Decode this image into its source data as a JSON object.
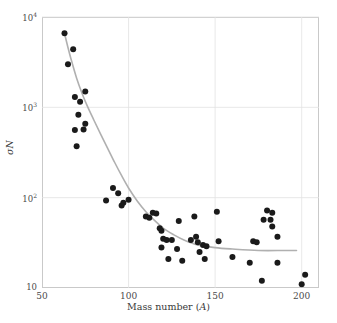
{
  "chart_data": {
    "type": "scatter",
    "title": "",
    "xlabel": "Mass number (A)",
    "ylabel": "σN",
    "xlabel_plain": "Mass number",
    "xlabel_symbol": "A",
    "ylabel_symbol": "σN",
    "xlim": [
      50,
      210
    ],
    "ylim": [
      10,
      10000
    ],
    "yscale": "log",
    "xscale": "linear",
    "grid": true,
    "legend": null,
    "xticks": [
      50,
      100,
      150,
      200
    ],
    "xtick_labels": [
      "50",
      "100",
      "150",
      "200"
    ],
    "yticks": [
      10,
      100,
      1000,
      10000
    ],
    "ytick_labels": [
      "10",
      "10²",
      "10³",
      "10⁴"
    ],
    "marker": {
      "shape": "circle",
      "color": "#1a1a1a",
      "size": 3.0
    },
    "points": [
      {
        "x": 63,
        "y": 6600
      },
      {
        "x": 68,
        "y": 4400
      },
      {
        "x": 65,
        "y": 3000
      },
      {
        "x": 69,
        "y": 1300
      },
      {
        "x": 75,
        "y": 1500
      },
      {
        "x": 72,
        "y": 1150
      },
      {
        "x": 71,
        "y": 830
      },
      {
        "x": 75,
        "y": 660
      },
      {
        "x": 69,
        "y": 560
      },
      {
        "x": 74,
        "y": 570
      },
      {
        "x": 70,
        "y": 370
      },
      {
        "x": 87,
        "y": 93
      },
      {
        "x": 91,
        "y": 128
      },
      {
        "x": 94,
        "y": 112
      },
      {
        "x": 97,
        "y": 88
      },
      {
        "x": 96,
        "y": 82
      },
      {
        "x": 100,
        "y": 95
      },
      {
        "x": 110,
        "y": 62
      },
      {
        "x": 112,
        "y": 60
      },
      {
        "x": 114,
        "y": 68
      },
      {
        "x": 116,
        "y": 67
      },
      {
        "x": 118,
        "y": 46
      },
      {
        "x": 119,
        "y": 43
      },
      {
        "x": 120,
        "y": 35
      },
      {
        "x": 119,
        "y": 28
      },
      {
        "x": 122,
        "y": 34
      },
      {
        "x": 123,
        "y": 21
      },
      {
        "x": 125,
        "y": 34
      },
      {
        "x": 128,
        "y": 27
      },
      {
        "x": 129,
        "y": 55
      },
      {
        "x": 131,
        "y": 20
      },
      {
        "x": 136,
        "y": 34
      },
      {
        "x": 138,
        "y": 62
      },
      {
        "x": 139,
        "y": 37
      },
      {
        "x": 140,
        "y": 32
      },
      {
        "x": 141,
        "y": 25
      },
      {
        "x": 143,
        "y": 30
      },
      {
        "x": 144,
        "y": 21
      },
      {
        "x": 145,
        "y": 29
      },
      {
        "x": 151,
        "y": 70
      },
      {
        "x": 152,
        "y": 33
      },
      {
        "x": 160,
        "y": 22
      },
      {
        "x": 170,
        "y": 19
      },
      {
        "x": 172,
        "y": 33
      },
      {
        "x": 174,
        "y": 32
      },
      {
        "x": 177,
        "y": 12
      },
      {
        "x": 178,
        "y": 57
      },
      {
        "x": 180,
        "y": 72
      },
      {
        "x": 182,
        "y": 57
      },
      {
        "x": 183,
        "y": 68
      },
      {
        "x": 183,
        "y": 48
      },
      {
        "x": 186,
        "y": 37
      },
      {
        "x": 186,
        "y": 19
      },
      {
        "x": 200,
        "y": 11
      },
      {
        "x": 202,
        "y": 14
      }
    ],
    "fit_curve": {
      "style": "solid",
      "color": "#b0b0b0",
      "width": 1.6,
      "description": "smooth decaying trend line through the data",
      "points": [
        {
          "x": 63,
          "y": 6600
        },
        {
          "x": 65,
          "y": 4600
        },
        {
          "x": 67,
          "y": 3300
        },
        {
          "x": 70,
          "y": 2100
        },
        {
          "x": 73,
          "y": 1450
        },
        {
          "x": 76,
          "y": 1050
        },
        {
          "x": 80,
          "y": 720
        },
        {
          "x": 84,
          "y": 500
        },
        {
          "x": 88,
          "y": 350
        },
        {
          "x": 92,
          "y": 245
        },
        {
          "x": 96,
          "y": 175
        },
        {
          "x": 100,
          "y": 128
        },
        {
          "x": 105,
          "y": 92
        },
        {
          "x": 110,
          "y": 70
        },
        {
          "x": 115,
          "y": 56
        },
        {
          "x": 120,
          "y": 46
        },
        {
          "x": 126,
          "y": 39
        },
        {
          "x": 132,
          "y": 34
        },
        {
          "x": 140,
          "y": 30
        },
        {
          "x": 150,
          "y": 28
        },
        {
          "x": 160,
          "y": 27
        },
        {
          "x": 175,
          "y": 26
        },
        {
          "x": 190,
          "y": 26
        },
        {
          "x": 197,
          "y": 26
        }
      ]
    }
  }
}
